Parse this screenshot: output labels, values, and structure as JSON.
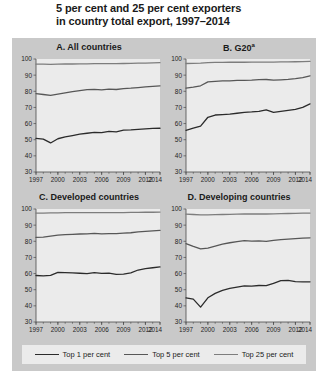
{
  "figure": {
    "title": "5 per cent and 25 per cent exporters in country total export, 1997–2014",
    "title_line1": "5 per cent and 25 per cent exporters",
    "title_line2": "in country total export, 1997–2014",
    "background_color": "#c9c9c9",
    "panel_background_color": "#ebebeb"
  },
  "legend": {
    "position": "bottom",
    "items": [
      {
        "label": "Top 1 per cent",
        "color": "#2b2b2b"
      },
      {
        "label": "Top 5 per cent",
        "color": "#575757"
      },
      {
        "label": "Top 25 per cent",
        "color": "#7d7d7d"
      }
    ]
  },
  "chart_data": [
    {
      "type": "line",
      "panel": "A",
      "title": "A. All countries",
      "xlabel": "",
      "ylabel": "",
      "grid": false,
      "x": [
        1997,
        1998,
        1999,
        2000,
        2001,
        2002,
        2003,
        2004,
        2005,
        2006,
        2007,
        2008,
        2009,
        2010,
        2011,
        2012,
        2013,
        2014
      ],
      "xticks": [
        1997,
        2000,
        2003,
        2006,
        2009,
        2012,
        2014
      ],
      "xlim": [
        1997,
        2014
      ],
      "ylim": [
        30,
        100
      ],
      "yticks": [
        30,
        40,
        50,
        60,
        70,
        80,
        90,
        100
      ],
      "series": [
        {
          "name": "Top 1 per cent",
          "color": "#2b2b2b",
          "values": [
            50.8,
            50.4,
            48.0,
            50.6,
            51.7,
            52.6,
            53.4,
            54.0,
            54.6,
            54.4,
            55.2,
            54.8,
            55.9,
            56.1,
            56.4,
            56.7,
            57.0,
            57.1
          ]
        },
        {
          "name": "Top 5 per cent",
          "color": "#575757",
          "values": [
            78.6,
            78.0,
            77.5,
            78.2,
            79.0,
            79.8,
            80.4,
            81.0,
            81.2,
            80.9,
            81.3,
            81.1,
            81.6,
            81.9,
            82.3,
            82.7,
            83.1,
            83.4
          ]
        },
        {
          "name": "Top 25 per cent",
          "color": "#7d7d7d",
          "values": [
            96.8,
            96.8,
            96.7,
            96.8,
            96.9,
            96.9,
            97.0,
            97.0,
            97.1,
            97.1,
            97.1,
            97.1,
            97.2,
            97.3,
            97.4,
            97.5,
            97.6,
            97.7
          ]
        }
      ]
    },
    {
      "type": "line",
      "panel": "B",
      "title": "B. G20",
      "title_superscript": "a",
      "xlabel": "",
      "ylabel": "",
      "grid": false,
      "x": [
        1997,
        1998,
        1999,
        2000,
        2001,
        2002,
        2003,
        2004,
        2005,
        2006,
        2007,
        2008,
        2009,
        2010,
        2011,
        2012,
        2013,
        2014
      ],
      "xticks": [
        1997,
        2000,
        2003,
        2006,
        2009,
        2012,
        2014
      ],
      "xlim": [
        1997,
        2014
      ],
      "ylim": [
        30,
        100
      ],
      "yticks": [
        30,
        40,
        50,
        60,
        70,
        80,
        90,
        100
      ],
      "series": [
        {
          "name": "Top 1 per cent",
          "color": "#2b2b2b",
          "values": [
            55.8,
            57.2,
            58.4,
            63.9,
            65.3,
            65.6,
            65.9,
            66.4,
            66.9,
            67.2,
            67.6,
            68.5,
            67.0,
            67.6,
            68.2,
            68.8,
            70.0,
            72.2
          ]
        },
        {
          "name": "Top 5 per cent",
          "color": "#575757",
          "values": [
            82.0,
            82.6,
            83.4,
            85.8,
            86.2,
            86.4,
            86.5,
            86.7,
            86.8,
            86.9,
            87.2,
            87.3,
            86.9,
            87.1,
            87.4,
            87.8,
            88.4,
            89.6
          ]
        },
        {
          "name": "Top 25 per cent",
          "color": "#7d7d7d",
          "values": [
            97.2,
            97.3,
            97.4,
            97.8,
            97.9,
            97.9,
            98.0,
            98.0,
            98.0,
            98.1,
            98.1,
            98.1,
            98.1,
            98.2,
            98.2,
            98.3,
            98.4,
            98.5
          ]
        }
      ]
    },
    {
      "type": "line",
      "panel": "C",
      "title": "C. Developed countries",
      "xlabel": "",
      "ylabel": "",
      "grid": false,
      "x": [
        1997,
        1998,
        1999,
        2000,
        2001,
        2002,
        2003,
        2004,
        2005,
        2006,
        2007,
        2008,
        2009,
        2010,
        2011,
        2012,
        2013,
        2014
      ],
      "xticks": [
        1997,
        2000,
        2003,
        2006,
        2009,
        2012,
        2014
      ],
      "xlim": [
        1997,
        2014
      ],
      "ylim": [
        30,
        100
      ],
      "yticks": [
        30,
        40,
        50,
        60,
        70,
        80,
        90,
        100
      ],
      "series": [
        {
          "name": "Top 1 per cent",
          "color": "#2b2b2b",
          "values": [
            58.8,
            58.6,
            58.9,
            60.7,
            60.6,
            60.4,
            60.2,
            60.0,
            60.6,
            60.1,
            60.3,
            59.5,
            59.7,
            60.4,
            62.2,
            63.1,
            63.6,
            64.1
          ]
        },
        {
          "name": "Top 5 per cent",
          "color": "#575757",
          "values": [
            82.4,
            82.6,
            83.2,
            83.8,
            84.1,
            84.3,
            84.5,
            84.6,
            84.9,
            84.6,
            84.8,
            84.8,
            85.0,
            85.3,
            85.8,
            86.2,
            86.5,
            86.7
          ]
        },
        {
          "name": "Top 25 per cent",
          "color": "#7d7d7d",
          "values": [
            97.5,
            97.5,
            97.6,
            97.6,
            97.7,
            97.7,
            97.7,
            97.7,
            97.8,
            97.8,
            97.8,
            97.8,
            97.8,
            97.9,
            97.9,
            98.0,
            98.0,
            98.1
          ]
        }
      ]
    },
    {
      "type": "line",
      "panel": "D",
      "title": "D. Developing countries",
      "xlabel": "",
      "ylabel": "",
      "grid": false,
      "x": [
        1997,
        1998,
        1999,
        2000,
        2001,
        2002,
        2003,
        2004,
        2005,
        2006,
        2007,
        2008,
        2009,
        2010,
        2011,
        2012,
        2013,
        2014
      ],
      "xticks": [
        1997,
        2000,
        2003,
        2006,
        2009,
        2012,
        2014
      ],
      "xlim": [
        1997,
        2014
      ],
      "ylim": [
        30,
        100
      ],
      "yticks": [
        30,
        40,
        50,
        60,
        70,
        80,
        90,
        100
      ],
      "series": [
        {
          "name": "Top 1 per cent",
          "color": "#2b2b2b",
          "values": [
            45.0,
            44.2,
            39.2,
            45.0,
            47.7,
            49.6,
            50.8,
            51.6,
            52.4,
            52.2,
            52.6,
            52.5,
            54.0,
            55.6,
            55.8,
            55.0,
            54.8,
            54.9
          ]
        },
        {
          "name": "Top 5 per cent",
          "color": "#575757",
          "values": [
            78.6,
            76.8,
            75.3,
            75.8,
            77.0,
            78.2,
            79.1,
            79.8,
            80.4,
            80.1,
            80.2,
            80.0,
            80.6,
            81.0,
            81.3,
            81.6,
            81.9,
            82.1
          ]
        },
        {
          "name": "Top 25 per cent",
          "color": "#7d7d7d",
          "values": [
            96.8,
            96.6,
            96.3,
            96.4,
            96.5,
            96.6,
            96.7,
            96.8,
            96.9,
            96.9,
            96.9,
            96.9,
            97.0,
            97.1,
            97.2,
            97.3,
            97.4,
            97.5
          ]
        }
      ]
    }
  ]
}
